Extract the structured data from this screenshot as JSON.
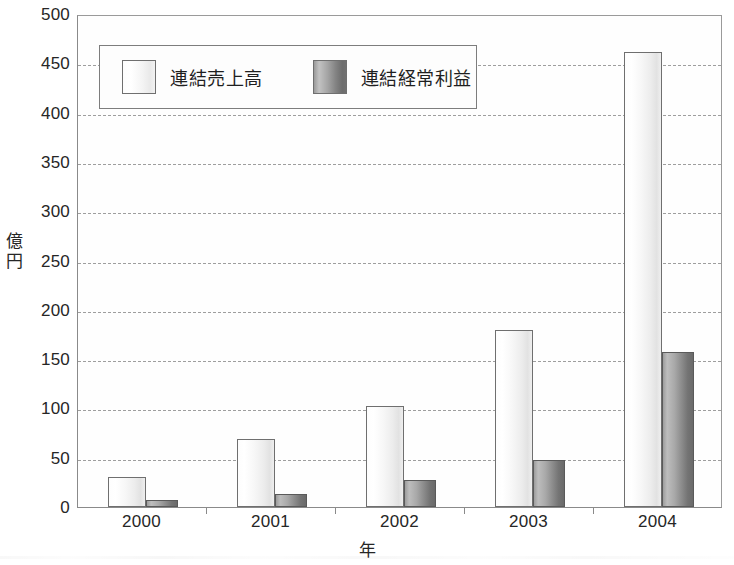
{
  "chart_data": {
    "type": "bar",
    "title": "",
    "xlabel": "年",
    "ylabel": "億円",
    "categories": [
      "2000",
      "2001",
      "2002",
      "2003",
      "2004"
    ],
    "series": [
      {
        "name": "連結売上高",
        "values": [
          30,
          69,
          102,
          180,
          461
        ]
      },
      {
        "name": "連結経常利益",
        "values": [
          7,
          13,
          27,
          48,
          157
        ]
      }
    ],
    "ylim": [
      0,
      500
    ],
    "yticks": [
      0,
      50,
      100,
      150,
      200,
      250,
      300,
      350,
      400,
      450,
      500
    ],
    "ytick_labels": [
      "0",
      "50",
      "100",
      "150",
      "200",
      "250",
      "300",
      "350",
      "400",
      "450",
      "500"
    ],
    "grid": "horizontal-dashed",
    "legend_position": "top-left-inside",
    "colors": {
      "sales_fill": "#f2f2f2",
      "profit_fill": "#8c8c8c",
      "axis": "#8a8a8a",
      "gridline": "#9e9e9e",
      "text": "#262626",
      "background": "#ffffff"
    }
  },
  "legend": {
    "items": [
      {
        "label": "連結売上高",
        "swatch": "light-gradient-swatch"
      },
      {
        "label": "連結経常利益",
        "swatch": "dark-gradient-swatch"
      }
    ]
  }
}
